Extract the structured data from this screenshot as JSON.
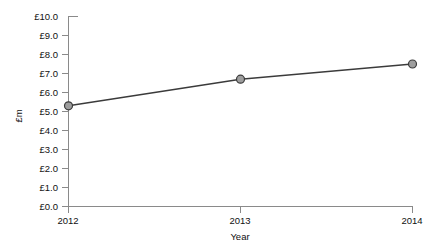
{
  "chart_data": {
    "type": "line",
    "title": "",
    "subtitle": "",
    "xlabel": "Year",
    "ylabel": "£m",
    "categories": [
      "2012",
      "2013",
      "2014"
    ],
    "x": [
      2012,
      2013,
      2014
    ],
    "values": [
      5.3,
      6.7,
      7.5
    ],
    "series": [
      {
        "name": "£m",
        "values": [
          5.3,
          6.7,
          7.5
        ]
      }
    ],
    "xlim": [
      2012,
      2014
    ],
    "ylim": [
      0.0,
      10.0
    ],
    "y_tick_labels": [
      "£0.0",
      "£1.0",
      "£2.0",
      "£3.0",
      "£4.0",
      "£5.0",
      "£6.0",
      "£7.0",
      "£8.0",
      "£9.0",
      "£10.0"
    ],
    "y_tick_values": [
      0,
      1,
      2,
      3,
      4,
      5,
      6,
      7,
      8,
      9,
      10
    ],
    "x_tick_labels": [
      "2012",
      "2013",
      "2014"
    ],
    "grid": false,
    "legend": false,
    "legend_position": "none",
    "marker": "circle",
    "colors": {
      "line": "#3b3b3b",
      "marker_fill": "#9e9e9e",
      "marker_edge": "#3b3b3b",
      "axis": "#8a8a8a",
      "text": "#111111",
      "background": "#ffffff"
    }
  }
}
